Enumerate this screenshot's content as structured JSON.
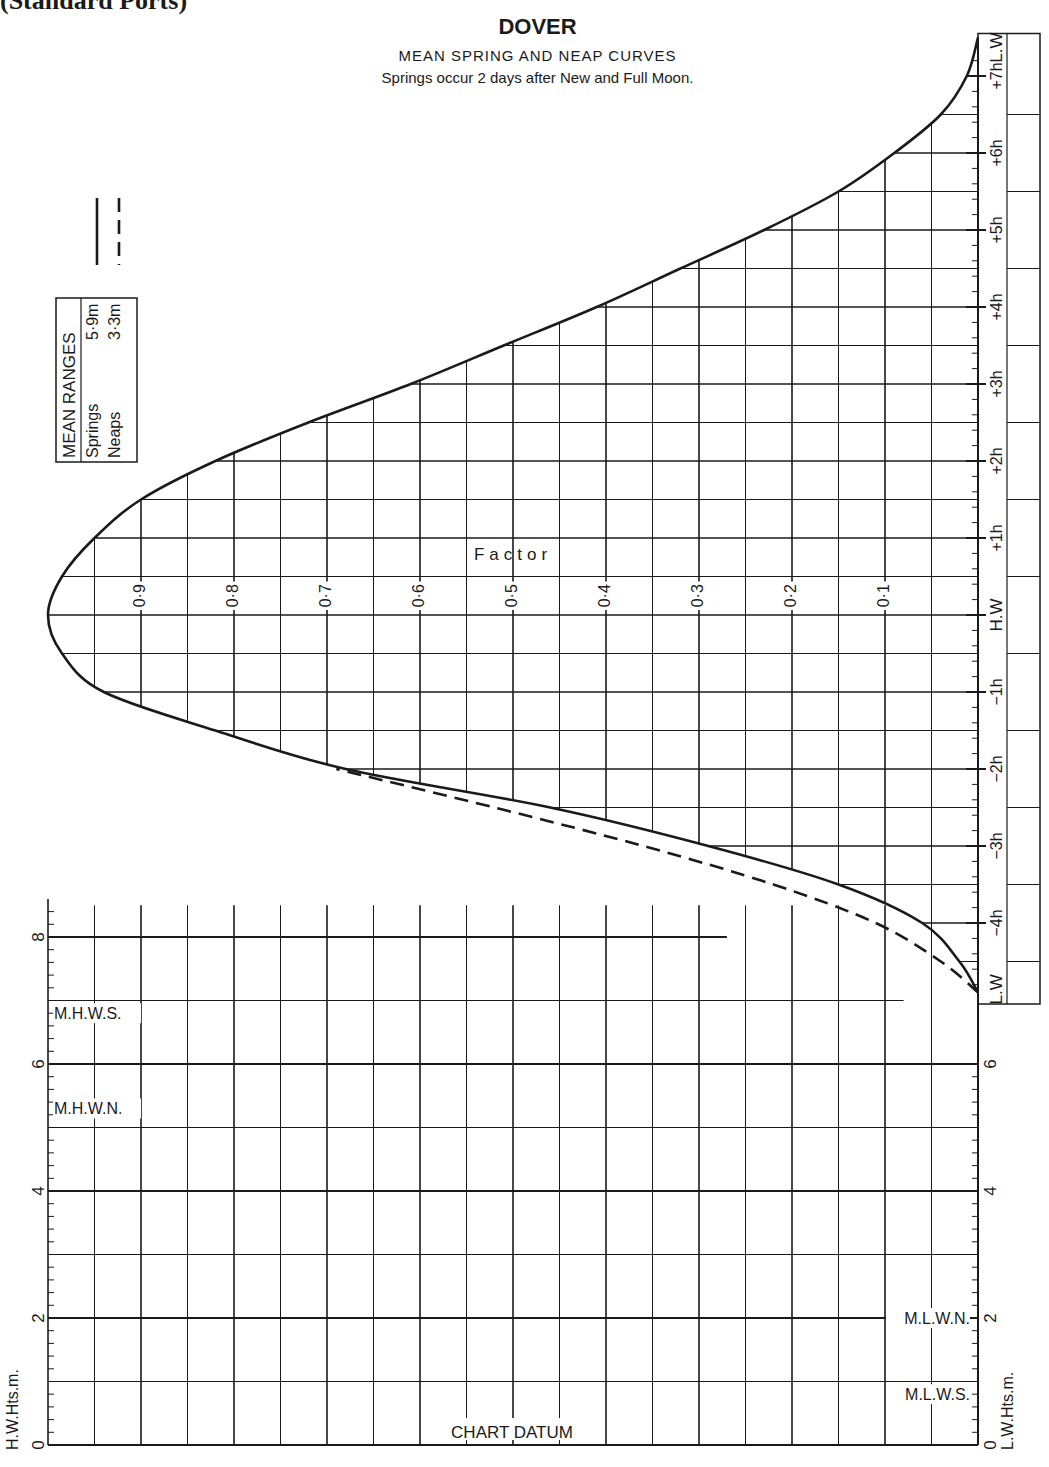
{
  "page": {
    "header_text": "(Standard Ports)"
  },
  "chart_data": {
    "type": "line",
    "title": "DOVER",
    "subtitle": "MEAN SPRING AND NEAP CURVES",
    "note": "Springs occur 2 days after New and Full Moon.",
    "factor_axis": {
      "label": "Factor",
      "range": [
        0,
        1
      ],
      "ticks": [
        0.1,
        0.2,
        0.3,
        0.4,
        0.5,
        0.6,
        0.7,
        0.8,
        0.9
      ],
      "tick_labels": [
        "0·1",
        "0·2",
        "0·3",
        "0·4",
        "0·5",
        "0·6",
        "0·7",
        "0·8",
        "0·9"
      ]
    },
    "time_axis": {
      "unit": "hours relative to H.W",
      "range": [
        -5,
        7.5
      ],
      "ticks": [
        {
          "value": -4.9,
          "label": "L.W"
        },
        {
          "value": -4,
          "label": "−4h"
        },
        {
          "value": -3,
          "label": "−3h"
        },
        {
          "value": -2,
          "label": "−2h"
        },
        {
          "value": -1,
          "label": "−1h"
        },
        {
          "value": 0,
          "label": "H.W"
        },
        {
          "value": 1,
          "label": "+1h"
        },
        {
          "value": 2,
          "label": "+2h"
        },
        {
          "value": 3,
          "label": "+3h"
        },
        {
          "value": 4,
          "label": "+4h"
        },
        {
          "value": 5,
          "label": "+5h"
        },
        {
          "value": 6,
          "label": "+6h"
        },
        {
          "value": 7,
          "label": "+7h"
        },
        {
          "value": 7.5,
          "label": "L.W"
        }
      ]
    },
    "series": [
      {
        "name": "Springs",
        "style": "solid",
        "points": [
          [
            -4.9,
            0.0
          ],
          [
            -4.5,
            0.02
          ],
          [
            -4.0,
            0.06
          ],
          [
            -3.5,
            0.15
          ],
          [
            -3.0,
            0.29
          ],
          [
            -2.5,
            0.46
          ],
          [
            -2.0,
            0.68
          ],
          [
            -1.5,
            0.82
          ],
          [
            -1.0,
            0.94
          ],
          [
            -0.5,
            0.985
          ],
          [
            0.0,
            1.0
          ],
          [
            0.5,
            0.985
          ],
          [
            1.0,
            0.95
          ],
          [
            1.5,
            0.9
          ],
          [
            2.0,
            0.82
          ],
          [
            2.5,
            0.72
          ],
          [
            3.0,
            0.61
          ],
          [
            3.5,
            0.51
          ],
          [
            4.0,
            0.41
          ],
          [
            4.5,
            0.32
          ],
          [
            5.0,
            0.23
          ],
          [
            5.5,
            0.15
          ],
          [
            6.0,
            0.09
          ],
          [
            6.5,
            0.04
          ],
          [
            7.0,
            0.012
          ],
          [
            7.5,
            0.0
          ]
        ]
      },
      {
        "name": "Neaps",
        "style": "dashed",
        "points": [
          [
            -4.9,
            0.0
          ],
          [
            -4.5,
            0.04
          ],
          [
            -4.0,
            0.11
          ],
          [
            -3.5,
            0.22
          ],
          [
            -3.0,
            0.36
          ],
          [
            -2.5,
            0.52
          ],
          [
            -2.0,
            0.69
          ]
        ]
      }
    ],
    "legend": {
      "position": "top-left",
      "entries": [
        {
          "name": "Springs",
          "style": "solid"
        },
        {
          "name": "Neaps",
          "style": "dashed"
        }
      ]
    },
    "mean_ranges": {
      "title": "MEAN RANGES",
      "rows": [
        {
          "label": "Springs",
          "value": "5·9m"
        },
        {
          "label": "Neaps",
          "value": "3·3m"
        }
      ]
    },
    "height_axes": {
      "left_label": "H.W.Hts.m.",
      "right_label": "L.W.Hts.m.",
      "range": [
        0,
        9
      ],
      "left_ticks": [
        0,
        2,
        4,
        6,
        8
      ],
      "right_ticks": [
        0,
        2,
        4,
        6
      ],
      "left_markers": [
        {
          "label": "M.H.W.S.",
          "value": 6.8
        },
        {
          "label": "M.H.W.N.",
          "value": 5.3
        }
      ],
      "right_markers": [
        {
          "label": "M.L.W.N.",
          "value": 2.0
        },
        {
          "label": "M.L.W.S.",
          "value": 0.8
        }
      ],
      "datum_label": "CHART DATUM"
    },
    "grid": true
  }
}
